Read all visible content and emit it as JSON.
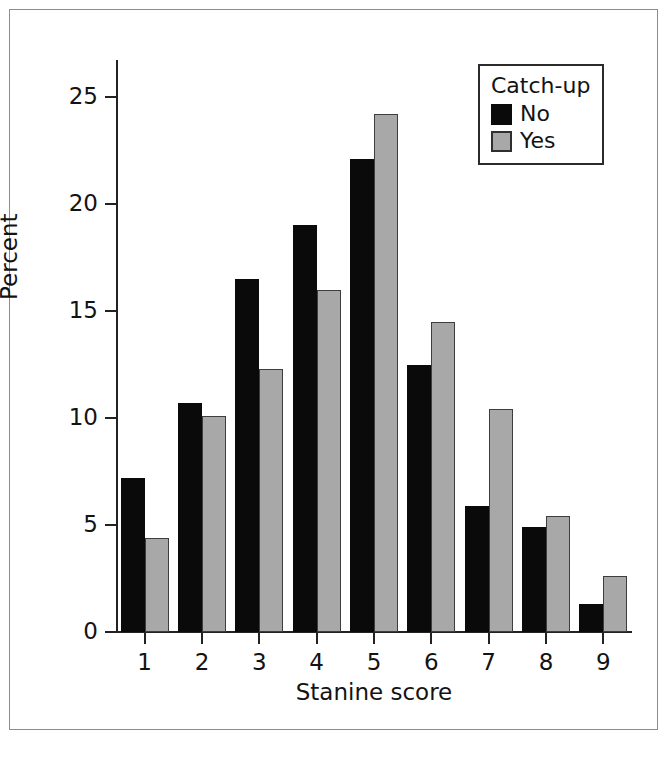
{
  "chart_data": {
    "type": "bar",
    "title": "",
    "xlabel": "Stanine score",
    "ylabel": "Percent",
    "categories": [
      "1",
      "2",
      "3",
      "4",
      "5",
      "6",
      "7",
      "8",
      "9"
    ],
    "series": [
      {
        "name": "No",
        "color": "#0a0a0a",
        "values": [
          7.2,
          10.7,
          16.5,
          19.0,
          22.1,
          12.5,
          5.9,
          4.9,
          1.3
        ]
      },
      {
        "name": "Yes",
        "color": "#a8a8a8",
        "values": [
          4.4,
          10.1,
          12.3,
          16.0,
          24.2,
          14.5,
          10.4,
          5.4,
          2.6
        ]
      }
    ],
    "legend": {
      "title": "Catch-up",
      "position": "top-right",
      "entries": [
        "No",
        "Yes"
      ]
    },
    "ylim": [
      0,
      26
    ],
    "yticks": [
      "0",
      "5",
      "10",
      "15",
      "20",
      "25"
    ],
    "ytick_values": [
      0,
      5,
      10,
      15,
      20,
      25
    ],
    "grid": false
  }
}
